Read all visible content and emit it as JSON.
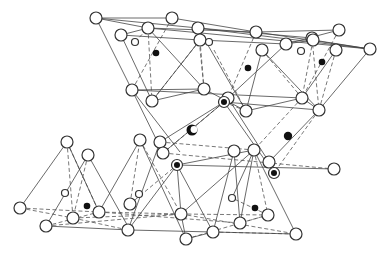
{
  "figure": {
    "title": "",
    "colors": {
      "line": "#444444",
      "dashed": "#555555",
      "atom_fill": "#ffffff",
      "dot": "#111111"
    }
  },
  "atoms": [
    {
      "x": 96,
      "y": 18,
      "r": 6
    },
    {
      "x": 148,
      "y": 28,
      "r": 6
    },
    {
      "x": 172,
      "y": 18,
      "r": 6
    },
    {
      "x": 198,
      "y": 28,
      "r": 6
    },
    {
      "x": 256,
      "y": 32,
      "r": 6
    },
    {
      "x": 312,
      "y": 38,
      "r": 6
    },
    {
      "x": 370,
      "y": 49,
      "r": 6
    },
    {
      "x": 121,
      "y": 35,
      "r": 6
    },
    {
      "x": 200,
      "y": 40,
      "r": 6
    },
    {
      "x": 262,
      "y": 50,
      "r": 6
    },
    {
      "x": 286,
      "y": 44,
      "r": 6
    },
    {
      "x": 313,
      "y": 40,
      "r": 6
    },
    {
      "x": 339,
      "y": 30,
      "r": 6
    },
    {
      "x": 336,
      "y": 50,
      "r": 6
    },
    {
      "x": 132,
      "y": 90,
      "r": 6
    },
    {
      "x": 152,
      "y": 101,
      "r": 6
    },
    {
      "x": 204,
      "y": 89,
      "r": 6
    },
    {
      "x": 246,
      "y": 111,
      "r": 6
    },
    {
      "x": 302,
      "y": 98,
      "r": 6
    },
    {
      "x": 319,
      "y": 110,
      "r": 6
    },
    {
      "x": 228,
      "y": 98,
      "r": 6
    },
    {
      "x": 160,
      "y": 142,
      "r": 6
    },
    {
      "x": 163,
      "y": 153,
      "r": 6
    },
    {
      "x": 254,
      "y": 150,
      "r": 6
    },
    {
      "x": 269,
      "y": 162,
      "r": 6
    },
    {
      "x": 334,
      "y": 169,
      "r": 6
    },
    {
      "x": 20,
      "y": 208,
      "r": 6
    },
    {
      "x": 67,
      "y": 142,
      "r": 6
    },
    {
      "x": 88,
      "y": 155,
      "r": 6
    },
    {
      "x": 46,
      "y": 226,
      "r": 6
    },
    {
      "x": 73,
      "y": 218,
      "r": 6
    },
    {
      "x": 99,
      "y": 212,
      "r": 6
    },
    {
      "x": 128,
      "y": 230,
      "r": 6
    },
    {
      "x": 130,
      "y": 204,
      "r": 6
    },
    {
      "x": 140,
      "y": 140,
      "r": 6
    },
    {
      "x": 181,
      "y": 214,
      "r": 6
    },
    {
      "x": 186,
      "y": 239,
      "r": 6
    },
    {
      "x": 213,
      "y": 232,
      "r": 6
    },
    {
      "x": 240,
      "y": 223,
      "r": 6
    },
    {
      "x": 268,
      "y": 215,
      "r": 6
    },
    {
      "x": 296,
      "y": 234,
      "r": 6
    },
    {
      "x": 234,
      "y": 151,
      "r": 6
    }
  ],
  "small_atoms": [
    {
      "x": 135,
      "y": 42,
      "r": 3.5
    },
    {
      "x": 209,
      "y": 42,
      "r": 3.5
    },
    {
      "x": 301,
      "y": 51,
      "r": 3.5
    },
    {
      "x": 65,
      "y": 193,
      "r": 3.5
    },
    {
      "x": 139,
      "y": 194,
      "r": 3.5
    },
    {
      "x": 232,
      "y": 198,
      "r": 3.5
    }
  ],
  "dots": [
    {
      "x": 156,
      "y": 53,
      "r": 3.3
    },
    {
      "x": 248,
      "y": 68,
      "r": 3.3
    },
    {
      "x": 322,
      "y": 62,
      "r": 3.3
    },
    {
      "x": 288,
      "y": 136,
      "r": 4.2
    },
    {
      "x": 87,
      "y": 206,
      "r": 3.3
    },
    {
      "x": 255,
      "y": 208,
      "r": 3.3
    }
  ],
  "ringed": [
    {
      "x": 224,
      "y": 102,
      "r": 5.5
    },
    {
      "x": 177,
      "y": 165,
      "r": 5.5
    },
    {
      "x": 274,
      "y": 173,
      "r": 5.5
    }
  ],
  "crescent": {
    "x": 192,
    "y": 130,
    "r": 5.5
  },
  "solid_lines": [
    [
      96,
      18,
      172,
      18
    ],
    [
      96,
      18,
      198,
      28
    ],
    [
      96,
      18,
      148,
      28
    ],
    [
      148,
      28,
      256,
      32
    ],
    [
      172,
      18,
      256,
      32
    ],
    [
      198,
      28,
      312,
      38
    ],
    [
      256,
      32,
      339,
      30
    ],
    [
      256,
      32,
      370,
      49
    ],
    [
      121,
      35,
      148,
      28
    ],
    [
      121,
      35,
      200,
      40
    ],
    [
      148,
      28,
      370,
      49
    ],
    [
      200,
      40,
      286,
      44
    ],
    [
      198,
      28,
      370,
      49
    ],
    [
      286,
      44,
      339,
      30
    ],
    [
      286,
      44,
      313,
      40
    ],
    [
      313,
      40,
      370,
      49
    ],
    [
      96,
      18,
      132,
      90
    ],
    [
      121,
      35,
      152,
      101
    ],
    [
      132,
      90,
      204,
      89
    ],
    [
      132,
      90,
      163,
      153
    ],
    [
      152,
      101,
      204,
      89
    ],
    [
      204,
      89,
      246,
      111
    ],
    [
      204,
      89,
      148,
      28
    ],
    [
      152,
      101,
      200,
      40
    ],
    [
      228,
      98,
      286,
      44
    ],
    [
      246,
      111,
      262,
      50
    ],
    [
      246,
      111,
      302,
      98
    ],
    [
      302,
      98,
      319,
      110
    ],
    [
      302,
      98,
      336,
      50
    ],
    [
      319,
      110,
      370,
      49
    ],
    [
      319,
      110,
      262,
      50
    ],
    [
      224,
      102,
      319,
      110
    ],
    [
      132,
      90,
      302,
      98
    ],
    [
      198,
      28,
      246,
      111
    ],
    [
      132,
      90,
      180,
      152
    ],
    [
      224,
      102,
      160,
      142
    ],
    [
      224,
      102,
      274,
      173
    ],
    [
      228,
      98,
      269,
      162
    ],
    [
      163,
      153,
      224,
      102
    ],
    [
      177,
      165,
      334,
      169
    ],
    [
      177,
      165,
      254,
      150
    ],
    [
      269,
      162,
      319,
      110
    ],
    [
      67,
      142,
      20,
      208
    ],
    [
      67,
      142,
      99,
      212
    ],
    [
      88,
      155,
      46,
      226
    ],
    [
      88,
      155,
      130,
      230
    ],
    [
      140,
      140,
      99,
      212
    ],
    [
      140,
      140,
      186,
      239
    ],
    [
      46,
      226,
      130,
      230
    ],
    [
      130,
      230,
      213,
      232
    ],
    [
      177,
      165,
      128,
      230
    ],
    [
      177,
      165,
      181,
      214
    ],
    [
      177,
      165,
      213,
      232
    ],
    [
      181,
      214,
      186,
      239
    ],
    [
      186,
      239,
      213,
      232
    ],
    [
      213,
      232,
      296,
      234
    ],
    [
      234,
      151,
      240,
      223
    ],
    [
      234,
      151,
      213,
      232
    ],
    [
      254,
      150,
      240,
      223
    ],
    [
      254,
      150,
      296,
      234
    ],
    [
      254,
      150,
      232,
      198
    ],
    [
      160,
      142,
      128,
      230
    ],
    [
      254,
      150,
      181,
      214
    ]
  ],
  "dashed_lines": [
    [
      135,
      42,
      148,
      28
    ],
    [
      148,
      28,
      152,
      101
    ],
    [
      172,
      18,
      132,
      90
    ],
    [
      198,
      28,
      204,
      89
    ],
    [
      200,
      40,
      204,
      89
    ],
    [
      200,
      40,
      152,
      101
    ],
    [
      214,
      50,
      246,
      111
    ],
    [
      256,
      32,
      228,
      98
    ],
    [
      262,
      50,
      302,
      98
    ],
    [
      313,
      40,
      302,
      98
    ],
    [
      336,
      50,
      319,
      110
    ],
    [
      339,
      30,
      302,
      98
    ],
    [
      312,
      38,
      319,
      110
    ],
    [
      246,
      111,
      224,
      102
    ],
    [
      319,
      110,
      274,
      173
    ],
    [
      302,
      98,
      254,
      150
    ],
    [
      224,
      102,
      163,
      153
    ],
    [
      163,
      153,
      334,
      169
    ],
    [
      160,
      142,
      254,
      150
    ],
    [
      20,
      208,
      99,
      212
    ],
    [
      20,
      208,
      73,
      218
    ],
    [
      67,
      142,
      73,
      218
    ],
    [
      88,
      155,
      73,
      218
    ],
    [
      67,
      142,
      99,
      212
    ],
    [
      46,
      226,
      99,
      212
    ],
    [
      46,
      226,
      181,
      214
    ],
    [
      73,
      218,
      128,
      230
    ],
    [
      99,
      212,
      240,
      223
    ],
    [
      99,
      212,
      181,
      214
    ],
    [
      73,
      218,
      181,
      214
    ],
    [
      181,
      214,
      296,
      234
    ],
    [
      130,
      204,
      140,
      140
    ],
    [
      130,
      204,
      177,
      165
    ],
    [
      140,
      140,
      181,
      214
    ],
    [
      181,
      214,
      268,
      215
    ],
    [
      186,
      239,
      268,
      215
    ],
    [
      240,
      223,
      268,
      215
    ],
    [
      268,
      215,
      232,
      198
    ],
    [
      254,
      150,
      268,
      215
    ],
    [
      213,
      232,
      296,
      234
    ]
  ]
}
